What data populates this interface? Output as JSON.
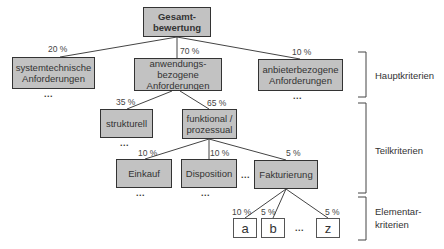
{
  "nodes": {
    "root": "Gesamt-\nbewertung",
    "systemtechnisch": "systemtechnische\nAnforderungen",
    "anwendungsbezogen": "anwendungs-\nbezogene\nAnforderungen",
    "anbieterbezogen": "anbieterbezogene\nAnforderungen",
    "strukturell": "strukturell",
    "funktional": "funktional /\nprozessual",
    "einkauf": "Einkauf",
    "disposition": "Disposition",
    "fakturierung": "Fakturierung",
    "a": "a",
    "b": "b",
    "z": "z"
  },
  "weights": {
    "systemtechnisch": "20 %",
    "anwendungsbezogen": "70 %",
    "anbieterbezogen": "10 %",
    "strukturell": "35 %",
    "funktional": "65 %",
    "einkauf": "10 %",
    "disposition": "10 %",
    "fakturierung": "5 %",
    "a": "10 %",
    "b": "5 %",
    "z": "5 %"
  },
  "ellipsis": "...",
  "levels": {
    "haupt": "Hauptkriterien",
    "teil": "Teilkriterien",
    "elementar": "Elementar-\nkriterien"
  }
}
